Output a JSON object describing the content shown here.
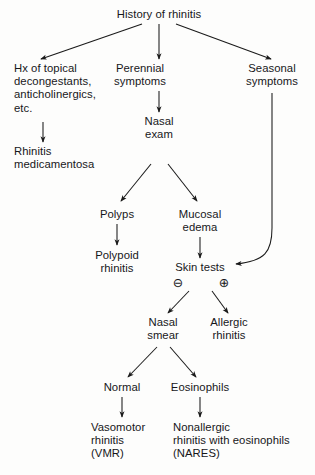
{
  "diagram": {
    "title": "History of rhinitis",
    "type": "clinical-decision-flowchart",
    "colors": {
      "background": "#fdfdfc",
      "text": "#17171a",
      "stroke": "#1a1a1a"
    },
    "nodes": {
      "root": {
        "label": "History of rhinitis",
        "lines": [
          "History of rhinitis"
        ]
      },
      "hx_topical": {
        "lines": [
          "Hx of topical",
          "decongestants,",
          "anticholinergics,",
          "etc."
        ]
      },
      "perennial": {
        "lines": [
          "Perennial",
          "symptoms"
        ]
      },
      "seasonal": {
        "lines": [
          "Seasonal",
          "symptoms"
        ]
      },
      "rhinitis_medicamentosa": {
        "lines": [
          "Rhinitis",
          "medicamentosa"
        ]
      },
      "nasal_exam": {
        "lines": [
          "Nasal",
          "exam"
        ]
      },
      "polyps": {
        "lines": [
          "Polyps"
        ]
      },
      "mucosal_edema": {
        "lines": [
          "Mucosal",
          "edema"
        ]
      },
      "polypoid_rhinitis": {
        "lines": [
          "Polypoid",
          "rhinitis"
        ]
      },
      "skin_tests": {
        "lines": [
          "Skin tests"
        ]
      },
      "nasal_smear": {
        "lines": [
          "Nasal",
          "smear"
        ]
      },
      "allergic_rhinitis": {
        "lines": [
          "Allergic",
          "rhinitis"
        ]
      },
      "normal": {
        "lines": [
          "Normal"
        ]
      },
      "eosinophils": {
        "lines": [
          "Eosinophils"
        ]
      },
      "vasomotor": {
        "lines": [
          "Vasomotor",
          "rhinitis",
          "(VMR)"
        ]
      },
      "nonallergic": {
        "lines": [
          "Nonallergic",
          "rhinitis with eosinophils",
          "(NARES)"
        ]
      }
    },
    "signs": {
      "negative": "⊖",
      "positive": "⊕"
    }
  }
}
